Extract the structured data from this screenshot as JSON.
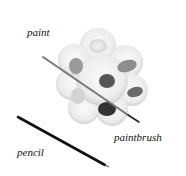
{
  "labels": {
    "paint": "paint",
    "paintbrush": "paintbrush",
    "pencil": "pencil"
  },
  "objects": [
    {
      "name": "paint-palette",
      "label": "paint"
    },
    {
      "name": "paintbrush",
      "label": "paintbrush"
    },
    {
      "name": "pencil",
      "label": "pencil"
    }
  ]
}
